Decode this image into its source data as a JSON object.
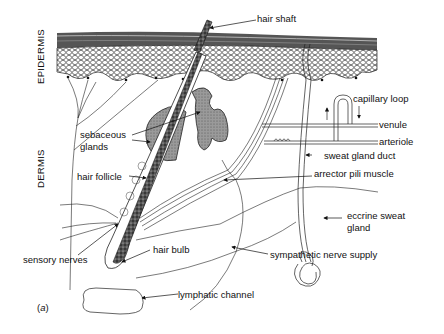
{
  "figure": {
    "panel_label_open": "(",
    "panel_label_letter": "a",
    "panel_label_close": ")",
    "layers": {
      "epidermis": "EPIDERMIS",
      "dermis": "DERMIS"
    },
    "labels": {
      "hair_shaft": "hair shaft",
      "capillary_loop": "capillary loop",
      "venule": "venule",
      "arteriole": "arteriole",
      "sweat_gland_duct": "sweat gland duct",
      "sebaceous_glands_line1": "sebaceous",
      "sebaceous_glands_line2": "glands",
      "hair_follicle": "hair follicle",
      "arrector_pili_muscle": "arrector pili muscle",
      "eccrine_sweat_gland_line1": "eccrine sweat",
      "eccrine_sweat_gland_line2": "gland",
      "sensory_nerves": "sensory nerves",
      "hair_bulb": "hair bulb",
      "sympathetic_nerve_supply": "sympathetic nerve supply",
      "lymphatic_channel": "lymphatic channel"
    },
    "colors": {
      "ink": "#111111",
      "gland_fill": "#8a8a8a",
      "stratum_dark": "#3a3a3a",
      "background": "#ffffff"
    }
  }
}
